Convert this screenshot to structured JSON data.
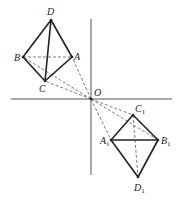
{
  "diagram": {
    "title": "",
    "origin_label": "O",
    "points": {
      "D": {
        "label": "D",
        "sub": ""
      },
      "B": {
        "label": "B",
        "sub": ""
      },
      "A": {
        "label": "A",
        "sub": ""
      },
      "C": {
        "label": "C",
        "sub": ""
      },
      "C1": {
        "label": "C",
        "sub": "1"
      },
      "A1": {
        "label": "A",
        "sub": "1"
      },
      "B1": {
        "label": "B",
        "sub": "1"
      },
      "D1": {
        "label": "D",
        "sub": "1"
      }
    },
    "solid_edges": [
      [
        "D",
        "B"
      ],
      [
        "D",
        "A"
      ],
      [
        "D",
        "C"
      ],
      [
        "B",
        "C"
      ],
      [
        "C",
        "A"
      ],
      [
        "A1",
        "C1"
      ],
      [
        "C1",
        "B1"
      ],
      [
        "A1",
        "B1"
      ],
      [
        "A1",
        "D1"
      ],
      [
        "B1",
        "D1"
      ]
    ],
    "dashed_edges": [
      [
        "B",
        "A"
      ],
      [
        "O",
        "A"
      ],
      [
        "O",
        "B"
      ],
      [
        "O",
        "C"
      ],
      [
        "O",
        "C1"
      ],
      [
        "O",
        "B1"
      ],
      [
        "O",
        "A1"
      ],
      [
        "C1",
        "D1"
      ]
    ]
  }
}
